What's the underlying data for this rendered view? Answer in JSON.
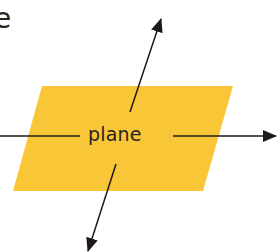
{
  "diagram": {
    "corner_text": "e",
    "plane_label": "plane",
    "colors": {
      "plane_fill": "#F9C637",
      "arrow": "#1f1a17",
      "text": "#2a2420",
      "background": "#ffffff"
    },
    "shapes": {
      "plane": {
        "type": "parallelogram",
        "points": [
          [
            42,
            86
          ],
          [
            233,
            86
          ],
          [
            203,
            191
          ],
          [
            13,
            191
          ]
        ]
      },
      "arrows": [
        {
          "name": "horizontal-arrow",
          "from": [
            0,
            136
          ],
          "to": [
            276,
            136
          ],
          "gap": [
            80,
            173
          ]
        },
        {
          "name": "up-arrow",
          "from": [
            130,
            112
          ],
          "to": [
            161,
            20
          ]
        },
        {
          "name": "down-arrow",
          "from": [
            116,
            164
          ],
          "to": [
            88,
            252
          ]
        }
      ]
    }
  }
}
